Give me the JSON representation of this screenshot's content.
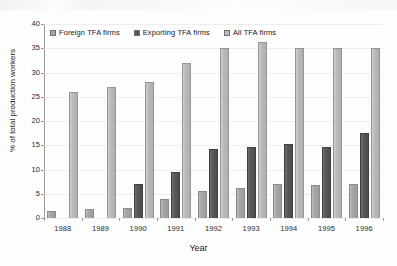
{
  "chart_data": {
    "type": "bar",
    "title": "",
    "xlabel": "Year",
    "ylabel": "% of total production workers",
    "categories": [
      "1988",
      "1989",
      "1990",
      "1991",
      "1992",
      "1993",
      "1994",
      "1995",
      "1996"
    ],
    "ylim": [
      0,
      40
    ],
    "yticks": [
      0,
      5,
      10,
      15,
      20,
      25,
      30,
      35,
      40
    ],
    "grid": true,
    "legend_position": "top-left inside",
    "series": [
      {
        "name": "Foreign TFA firms",
        "color": "#a6a6a6",
        "values": [
          1.5,
          1.8,
          2.0,
          4.0,
          5.5,
          6.2,
          7.0,
          6.8,
          7.0
        ]
      },
      {
        "name": "Exporting TFA firms",
        "color": "#575757",
        "values": [
          null,
          null,
          7.0,
          9.5,
          14.3,
          14.6,
          15.2,
          14.7,
          17.6
        ]
      },
      {
        "name": "All TFA firms",
        "color": "#b9b9b9",
        "values": [
          26.0,
          27.0,
          28.0,
          32.0,
          35.0,
          36.2,
          35.0,
          35.0,
          35.0
        ]
      }
    ]
  }
}
